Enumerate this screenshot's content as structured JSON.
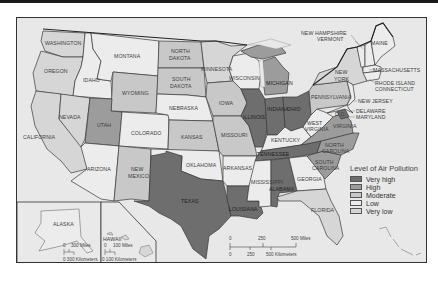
{
  "map": {
    "title": "",
    "legend": {
      "title": "Level of Air Pollution",
      "items": [
        {
          "label": "Very high",
          "color": "#6e6e6e"
        },
        {
          "label": "High",
          "color": "#9c9c9c"
        },
        {
          "label": "Moderate",
          "color": "#c8c8c8"
        },
        {
          "label": "Low",
          "color": "#ececec"
        },
        {
          "label": "Very low",
          "color": "#d6d6d6"
        }
      ]
    },
    "states": {
      "washington": {
        "name": "WASHINGTON",
        "level": "Very low"
      },
      "oregon": {
        "name": "OREGON",
        "level": "Very low"
      },
      "california": {
        "name": "CALIFORNIA",
        "level": "Very low"
      },
      "idaho": {
        "name": "IDAHO",
        "level": "Low"
      },
      "nevada": {
        "name": "NEVADA",
        "level": "Very low"
      },
      "montana": {
        "name": "MONTANA",
        "level": "Low"
      },
      "wyoming": {
        "name": "WYOMING",
        "level": "Moderate"
      },
      "utah": {
        "name": "UTAH",
        "level": "High"
      },
      "arizona": {
        "name": "ARIZONA",
        "level": "Low"
      },
      "colorado": {
        "name": "COLORADO",
        "level": "Low"
      },
      "new_mexico": {
        "name1": "NEW",
        "name2": "MEXICO",
        "level": "Moderate"
      },
      "north_dakota": {
        "name1": "NORTH",
        "name2": "DAKOTA",
        "level": "Moderate"
      },
      "south_dakota": {
        "name1": "SOUTH",
        "name2": "DAKOTA",
        "level": "Moderate"
      },
      "nebraska": {
        "name": "NEBRASKA",
        "level": "Low"
      },
      "kansas": {
        "name": "KANSAS",
        "level": "Moderate"
      },
      "oklahoma": {
        "name": "OKLAHOMA",
        "level": "Low"
      },
      "texas": {
        "name": "TEXAS",
        "level": "Very high"
      },
      "minnesota": {
        "name": "MINNESOTA",
        "level": "Very low"
      },
      "iowa": {
        "name": "IOWA",
        "level": "Moderate"
      },
      "missouri": {
        "name": "MISSOURI",
        "level": "Moderate"
      },
      "arkansas": {
        "name": "ARKANSAS",
        "level": "Low"
      },
      "louisiana": {
        "name": "LOUISIANA",
        "level": "Very high"
      },
      "wisconsin": {
        "name": "WISCONSIN",
        "level": "Low"
      },
      "illinois": {
        "name": "ILLINOIS",
        "level": "Very high"
      },
      "michigan": {
        "name": "MICHIGAN",
        "level": "High"
      },
      "indiana": {
        "name": "INDIANA",
        "level": "Very high"
      },
      "ohio": {
        "name": "OHIO",
        "level": "Very high"
      },
      "kentucky": {
        "name": "KENTUCKY",
        "level": "Low"
      },
      "tennessee": {
        "name": "TENNESSEE",
        "level": "Very high"
      },
      "mississippi": {
        "name": "MISSISSIPPI",
        "level": "Low"
      },
      "alabama": {
        "name": "ALABAMA",
        "level": "Very high"
      },
      "georgia": {
        "name": "GEORGIA",
        "level": "Low"
      },
      "florida": {
        "name": "FLORIDA",
        "level": "Very low"
      },
      "south_carolina": {
        "name1": "SOUTH",
        "name2": "CAROLINA",
        "level": "High"
      },
      "north_carolina": {
        "name1": "NORTH",
        "name2": "CAROLINA",
        "level": "High"
      },
      "virginia": {
        "name": "VIRGINIA",
        "level": "High"
      },
      "west_virginia": {
        "name1": "WEST",
        "name2": "VIRGINIA",
        "level": "Low"
      },
      "dc": {
        "name": "D.C.",
        "level": "Very high"
      },
      "pennsylvania": {
        "name": "PENNSYLVANIA",
        "level": "Moderate"
      },
      "new_york": {
        "name1": "NEW",
        "name2": "YORK",
        "level": "Very low"
      },
      "new_jersey": {
        "name": "NEW JERSEY",
        "level": "Low"
      },
      "delaware": {
        "name": "DELAWARE",
        "level": "Low"
      },
      "maryland": {
        "name": "MARYLAND",
        "level": "Low"
      },
      "new_hampshire": {
        "name": "NEW HAMPSHIRE",
        "level": "Low"
      },
      "vermont": {
        "name": "VERMONT",
        "level": "Low"
      },
      "maine": {
        "name": "MAINE",
        "level": "Low"
      },
      "massachusetts": {
        "name": "MASSACHUSETTS",
        "level": "Low"
      },
      "rhode_island": {
        "name": "RHODE ISLAND",
        "level": "Low"
      },
      "connecticut": {
        "name": "CONNECTICUT",
        "level": "Low"
      },
      "alaska": {
        "name": "ALASKA",
        "level": "Low"
      },
      "hawaii": {
        "name": "HAWAII",
        "level": "Very low"
      }
    },
    "scale_main": {
      "miles": [
        "0",
        "250",
        "500 Miles"
      ],
      "km": [
        "0",
        "250",
        "500 Kilometers"
      ]
    },
    "scale_alaska": {
      "miles": [
        "0",
        "300 Miles"
      ],
      "km": "0 300 Kilometers"
    },
    "scale_hawaii": {
      "miles": [
        "0",
        "100 Miles"
      ],
      "km": "0 100 Kilometers"
    }
  }
}
